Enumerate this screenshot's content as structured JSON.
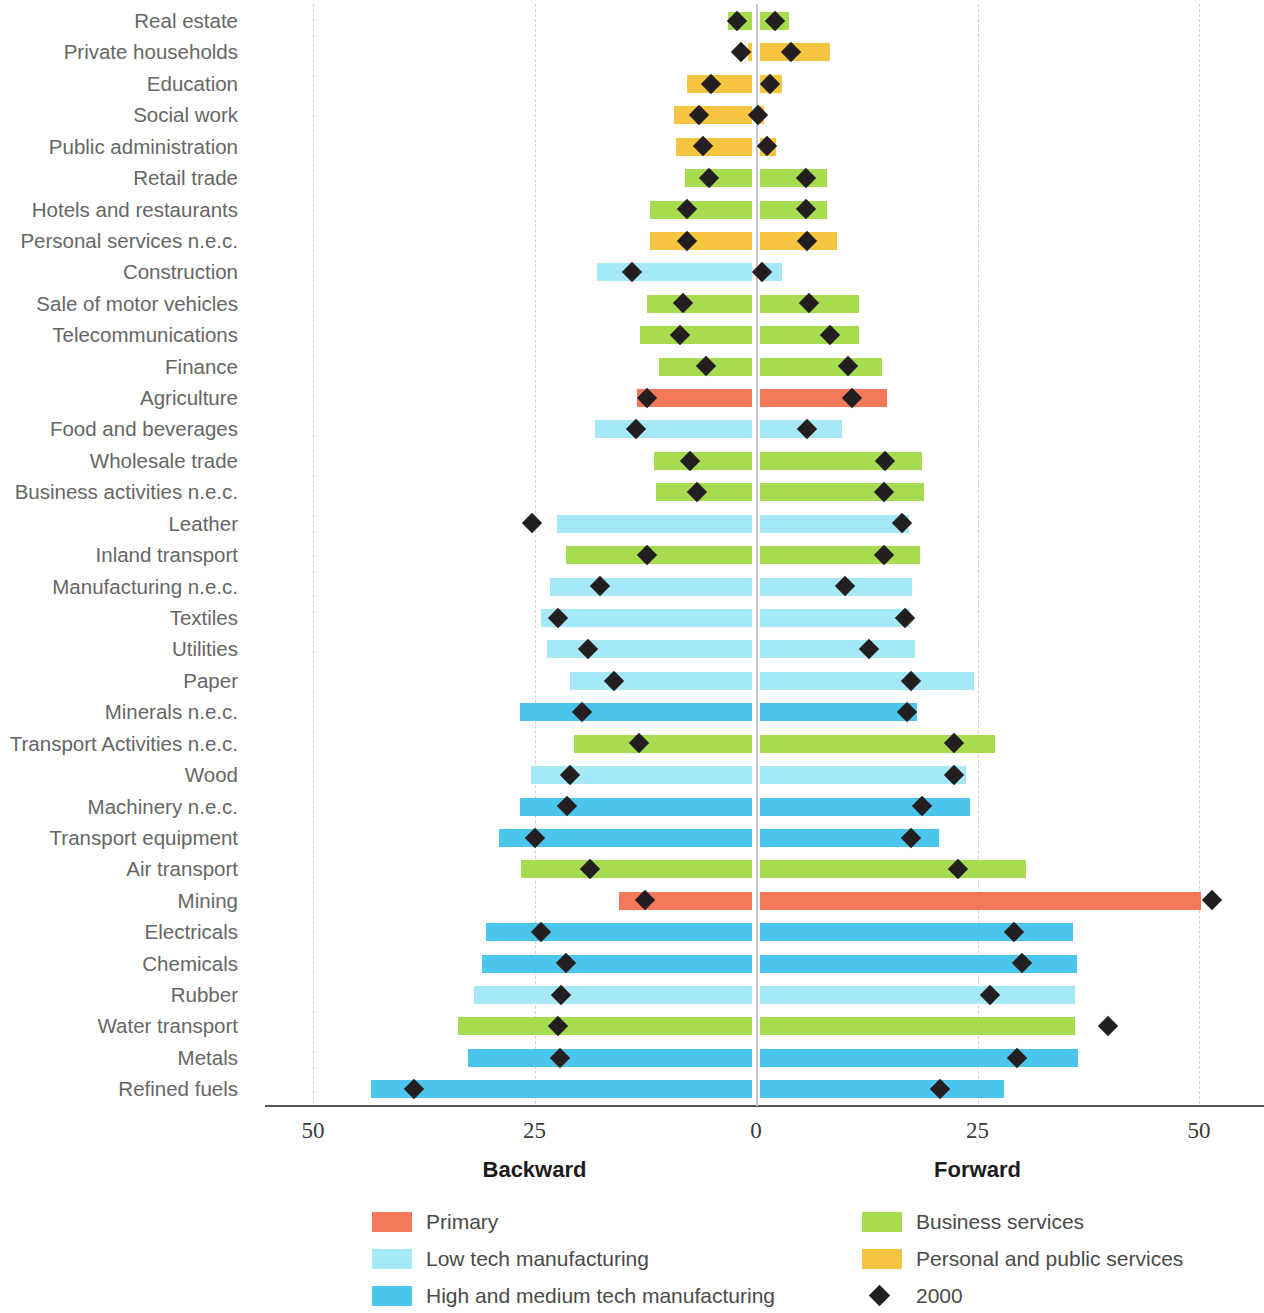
{
  "axis": {
    "ticks": [
      {
        "label": "50",
        "value": -50
      },
      {
        "label": "25",
        "value": -25
      },
      {
        "label": "0",
        "value": 0
      },
      {
        "label": "25",
        "value": 25
      },
      {
        "label": "50",
        "value": 50
      }
    ],
    "backward_label": "Backward",
    "forward_label": "Forward",
    "xmin": -55,
    "xmax": 57
  },
  "legend": {
    "items": [
      {
        "label": "Primary",
        "color": "#F4795B",
        "type": "swatch",
        "col": 0,
        "row": 0
      },
      {
        "label": "Low tech manufacturing",
        "color": "#A5E9F7",
        "type": "swatch",
        "col": 0,
        "row": 1
      },
      {
        "label": "High and medium tech manufacturing",
        "color": "#4BC5EC",
        "type": "swatch",
        "col": 0,
        "row": 2
      },
      {
        "label": "Business services",
        "color": "#A8DC50",
        "type": "swatch",
        "col": 1,
        "row": 0
      },
      {
        "label": "Personal and public services",
        "color": "#F5C542",
        "type": "swatch",
        "col": 1,
        "row": 1
      },
      {
        "label": "2000",
        "color": "#231f20",
        "type": "diamond",
        "col": 1,
        "row": 2
      }
    ]
  },
  "colors": {
    "primary": "#F4795B",
    "low_tech": "#A5E9F7",
    "high_tech": "#4BC5EC",
    "business_services": "#A8DC50",
    "personal_public": "#F5C542",
    "marker": "#231f20",
    "gridline": "#d2d2d2",
    "zeroline": "#c8c8c8",
    "axis": "#555555",
    "label_text": "#666666"
  },
  "chart_data": {
    "type": "bar",
    "title": "",
    "subtitle": "",
    "xlabel": "",
    "ylabel": "",
    "orientation": "horizontal-diverging",
    "xlim": [
      -55,
      57
    ],
    "grid": true,
    "legend_position": "bottom",
    "axis_note": "Left side = Backward linkages, right side = Forward linkages; both axes show magnitude 0-50",
    "series_names": [
      "Backward",
      "Forward",
      "2000"
    ],
    "categories": [
      "Real estate",
      "Private households",
      "Education",
      "Social work",
      "Public administration",
      "Retail trade",
      "Hotels and restaurants",
      "Personal services n.e.c.",
      "Construction",
      "Sale of motor vehicles",
      "Telecommunications",
      "Finance",
      "Agriculture",
      "Food and beverages",
      "Wholesale trade",
      "Business activities n.e.c.",
      "Leather",
      "Inland transport",
      "Manufacturing n.e.c.",
      "Textiles",
      "Utilities",
      "Paper",
      "Minerals n.e.c.",
      "Transport Activities n.e.c.",
      "Wood",
      "Machinery n.e.c.",
      "Transport equipment",
      "Air transport",
      "Mining",
      "Electricals",
      "Chemicals",
      "Rubber",
      "Water transport",
      "Metals",
      "Refined fuels"
    ],
    "rows": [
      {
        "category": "Real estate",
        "group": "business_services",
        "backward_start": 3.2,
        "backward_end": 0.4,
        "forward_start": 0.4,
        "forward_end": 3.7,
        "marker_backward": 2.2,
        "marker_forward": 2.2
      },
      {
        "category": "Private households",
        "group": "personal_public",
        "backward_start": 0.9,
        "backward_end": 0.4,
        "forward_start": 0.4,
        "forward_end": 8.4,
        "marker_backward": 1.7,
        "marker_forward": 4.0
      },
      {
        "category": "Education",
        "group": "personal_public",
        "backward_start": 7.8,
        "backward_end": 0.4,
        "forward_start": 0.4,
        "forward_end": 2.9,
        "marker_backward": 5.1,
        "marker_forward": 1.6
      },
      {
        "category": "Social work",
        "group": "personal_public",
        "backward_start": 9.3,
        "backward_end": 0.4,
        "forward_start": 0.4,
        "forward_end": 0.9,
        "marker_backward": 6.4,
        "marker_forward": 0.2
      },
      {
        "category": "Public administration",
        "group": "personal_public",
        "backward_start": 9.0,
        "backward_end": 0.4,
        "forward_start": 0.4,
        "forward_end": 2.3,
        "marker_backward": 6.0,
        "marker_forward": 1.2
      },
      {
        "category": "Retail trade",
        "group": "business_services",
        "backward_start": 8.0,
        "backward_end": 0.4,
        "forward_start": 0.4,
        "forward_end": 8.0,
        "marker_backward": 5.3,
        "marker_forward": 5.6
      },
      {
        "category": "Hotels and restaurants",
        "group": "business_services",
        "backward_start": 12.0,
        "backward_end": 0.4,
        "forward_start": 0.4,
        "forward_end": 8.0,
        "marker_backward": 7.8,
        "marker_forward": 5.6
      },
      {
        "category": "Personal services n.e.c.",
        "group": "personal_public",
        "backward_start": 12.0,
        "backward_end": 0.4,
        "forward_start": 0.4,
        "forward_end": 9.2,
        "marker_backward": 7.8,
        "marker_forward": 5.7
      },
      {
        "category": "Construction",
        "group": "low_tech",
        "backward_start": 18.0,
        "backward_end": 0.4,
        "forward_start": 0.4,
        "forward_end": 2.9,
        "marker_backward": 14.0,
        "marker_forward": 0.7
      },
      {
        "category": "Sale of motor vehicles",
        "group": "business_services",
        "backward_start": 12.3,
        "backward_end": 0.4,
        "forward_start": 0.4,
        "forward_end": 11.6,
        "marker_backward": 8.2,
        "marker_forward": 6.0
      },
      {
        "category": "Telecommunications",
        "group": "business_services",
        "backward_start": 13.1,
        "backward_end": 0.4,
        "forward_start": 0.4,
        "forward_end": 11.6,
        "marker_backward": 8.6,
        "marker_forward": 8.3
      },
      {
        "category": "Finance",
        "group": "business_services",
        "backward_start": 11.0,
        "backward_end": 0.4,
        "forward_start": 0.4,
        "forward_end": 14.2,
        "marker_backward": 5.6,
        "marker_forward": 10.4
      },
      {
        "category": "Agriculture",
        "group": "primary",
        "backward_start": 13.4,
        "backward_end": 0.4,
        "forward_start": 0.4,
        "forward_end": 14.8,
        "marker_backward": 12.3,
        "marker_forward": 10.8
      },
      {
        "category": "Food and beverages",
        "group": "low_tech",
        "backward_start": 18.2,
        "backward_end": 0.4,
        "forward_start": 0.4,
        "forward_end": 9.7,
        "marker_backward": 13.5,
        "marker_forward": 5.8
      },
      {
        "category": "Wholesale trade",
        "group": "business_services",
        "backward_start": 11.5,
        "backward_end": 0.4,
        "forward_start": 0.4,
        "forward_end": 18.7,
        "marker_backward": 7.5,
        "marker_forward": 14.6
      },
      {
        "category": "Business activities n.e.c.",
        "group": "business_services",
        "backward_start": 11.3,
        "backward_end": 0.4,
        "forward_start": 0.4,
        "forward_end": 19.0,
        "marker_backward": 6.7,
        "marker_forward": 14.5
      },
      {
        "category": "Leather",
        "group": "low_tech",
        "backward_start": 22.5,
        "backward_end": 0.4,
        "forward_start": 0.4,
        "forward_end": 17.3,
        "marker_backward": 25.3,
        "marker_forward": 16.5
      },
      {
        "category": "Inland transport",
        "group": "business_services",
        "backward_start": 21.5,
        "backward_end": 0.4,
        "forward_start": 0.4,
        "forward_end": 18.5,
        "marker_backward": 12.3,
        "marker_forward": 14.4
      },
      {
        "category": "Manufacturing n.e.c.",
        "group": "low_tech",
        "backward_start": 23.2,
        "backward_end": 0.4,
        "forward_start": 0.4,
        "forward_end": 17.6,
        "marker_backward": 17.6,
        "marker_forward": 10.0
      },
      {
        "category": "Textiles",
        "group": "low_tech",
        "backward_start": 24.3,
        "backward_end": 0.4,
        "forward_start": 0.4,
        "forward_end": 17.4,
        "marker_backward": 22.3,
        "marker_forward": 16.8
      },
      {
        "category": "Utilities",
        "group": "low_tech",
        "backward_start": 23.6,
        "backward_end": 0.4,
        "forward_start": 0.4,
        "forward_end": 18.0,
        "marker_backward": 19.0,
        "marker_forward": 12.8
      },
      {
        "category": "Paper",
        "group": "low_tech",
        "backward_start": 21.0,
        "backward_end": 0.4,
        "forward_start": 0.4,
        "forward_end": 24.6,
        "marker_backward": 16.0,
        "marker_forward": 17.5
      },
      {
        "category": "Minerals n.e.c.",
        "group": "high_tech",
        "backward_start": 26.6,
        "backward_end": 0.4,
        "forward_start": 0.4,
        "forward_end": 18.2,
        "marker_backward": 19.6,
        "marker_forward": 17.0
      },
      {
        "category": "Transport Activities n.e.c.",
        "group": "business_services",
        "backward_start": 20.5,
        "backward_end": 0.4,
        "forward_start": 0.4,
        "forward_end": 27.0,
        "marker_backward": 13.2,
        "marker_forward": 22.4
      },
      {
        "category": "Wood",
        "group": "low_tech",
        "backward_start": 25.4,
        "backward_end": 0.4,
        "forward_start": 0.4,
        "forward_end": 23.7,
        "marker_backward": 21.0,
        "marker_forward": 22.3
      },
      {
        "category": "Machinery n.e.c.",
        "group": "high_tech",
        "backward_start": 26.6,
        "backward_end": 0.4,
        "forward_start": 0.4,
        "forward_end": 24.2,
        "marker_backward": 21.3,
        "marker_forward": 18.7
      },
      {
        "category": "Transport equipment",
        "group": "high_tech",
        "backward_start": 29.0,
        "backward_end": 0.4,
        "forward_start": 0.4,
        "forward_end": 20.6,
        "marker_backward": 25.0,
        "marker_forward": 17.5
      },
      {
        "category": "Air transport",
        "group": "business_services",
        "backward_start": 26.5,
        "backward_end": 0.4,
        "forward_start": 0.4,
        "forward_end": 30.5,
        "marker_backward": 18.7,
        "marker_forward": 22.8
      },
      {
        "category": "Mining",
        "group": "primary",
        "backward_start": 15.5,
        "backward_end": 0.4,
        "forward_start": 0.4,
        "forward_end": 50.2,
        "marker_backward": 12.5,
        "marker_forward": 51.5
      },
      {
        "category": "Electricals",
        "group": "high_tech",
        "backward_start": 30.5,
        "backward_end": 0.4,
        "forward_start": 0.4,
        "forward_end": 35.8,
        "marker_backward": 24.3,
        "marker_forward": 29.1
      },
      {
        "category": "Chemicals",
        "group": "high_tech",
        "backward_start": 30.9,
        "backward_end": 0.4,
        "forward_start": 0.4,
        "forward_end": 36.2,
        "marker_backward": 21.5,
        "marker_forward": 30.0
      },
      {
        "category": "Rubber",
        "group": "low_tech",
        "backward_start": 31.8,
        "backward_end": 0.4,
        "forward_start": 0.4,
        "forward_end": 36.0,
        "marker_backward": 22.0,
        "marker_forward": 26.4
      },
      {
        "category": "Water transport",
        "group": "business_services",
        "backward_start": 33.6,
        "backward_end": 0.4,
        "forward_start": 0.4,
        "forward_end": 36.0,
        "marker_backward": 22.4,
        "marker_forward": 39.7
      },
      {
        "category": "Metals",
        "group": "high_tech",
        "backward_start": 32.5,
        "backward_end": 0.4,
        "forward_start": 0.4,
        "forward_end": 36.4,
        "marker_backward": 22.1,
        "marker_forward": 29.5
      },
      {
        "category": "Refined fuels",
        "group": "high_tech",
        "backward_start": 43.5,
        "backward_end": 0.4,
        "forward_start": 0.4,
        "forward_end": 28.0,
        "marker_backward": 38.6,
        "marker_forward": 20.8
      }
    ]
  }
}
